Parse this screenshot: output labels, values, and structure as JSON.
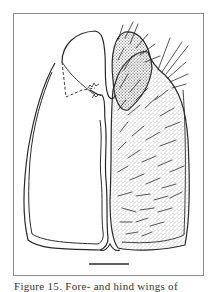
{
  "figure": {
    "caption": "Figure 15. Fore- and hind wings of",
    "scale_bar_label": "",
    "colors": {
      "line": "#2a2a2a",
      "frame": "#8a8a8a",
      "stipple": "#555555",
      "background": "#ffffff"
    }
  }
}
